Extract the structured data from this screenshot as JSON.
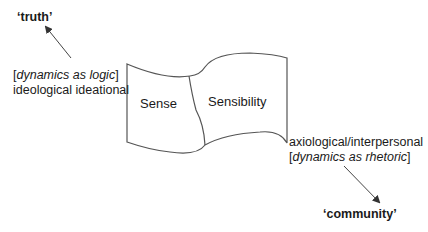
{
  "diagram": {
    "nodes": {
      "truth": {
        "label": "‘truth’"
      },
      "community": {
        "label": "‘community’"
      },
      "sense": {
        "label": "Sense"
      },
      "sensibility": {
        "label": "Sensibility"
      }
    },
    "annotations": {
      "left": {
        "bracket_open": "[",
        "italic": "dynamics as logic",
        "bracket_close": "]",
        "line2": "ideological ideational"
      },
      "right": {
        "line1": "axiological/interpersonal",
        "bracket_open": "[",
        "italic": "dynamics as rhetoric",
        "bracket_close": "]"
      }
    },
    "edges": [
      {
        "from": "left-annotation",
        "to": "truth"
      },
      {
        "from": "right-annotation",
        "to": "community"
      }
    ],
    "colors": {
      "stroke": "#555555",
      "text": "#1a1a1a"
    }
  }
}
